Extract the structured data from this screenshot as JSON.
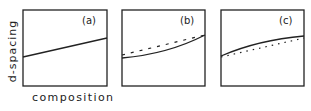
{
  "axes": {
    "ylabel": "d-spacing",
    "xlabel": "composition"
  },
  "panels": [
    {
      "label": "(a)",
      "description": "Linear relation (Vegard's law)",
      "curves": [
        {
          "style": "solid",
          "shape": "straight",
          "points": [
            [
              0,
              0.37
            ],
            [
              1,
              0.63
            ]
          ]
        }
      ]
    },
    {
      "label": "(b)",
      "description": "Negative deviation: solid curve below the dashed linear reference",
      "curves": [
        {
          "style": "dashed",
          "shape": "straight",
          "points": [
            [
              0,
              0.4
            ],
            [
              1,
              0.66
            ]
          ]
        },
        {
          "style": "solid",
          "shape": "concave-up",
          "points": [
            [
              0,
              0.37
            ],
            [
              1,
              0.66
            ]
          ]
        }
      ]
    },
    {
      "label": "(c)",
      "description": "Positive deviation: solid curve above the dotted linear reference",
      "curves": [
        {
          "style": "dotted",
          "shape": "straight",
          "points": [
            [
              0,
              0.38
            ],
            [
              1,
              0.62
            ]
          ]
        },
        {
          "style": "solid",
          "shape": "concave-down",
          "points": [
            [
              0,
              0.4
            ],
            [
              1,
              0.65
            ]
          ]
        }
      ]
    }
  ],
  "colors": {
    "line": "#222222",
    "background": "#ffffff"
  }
}
